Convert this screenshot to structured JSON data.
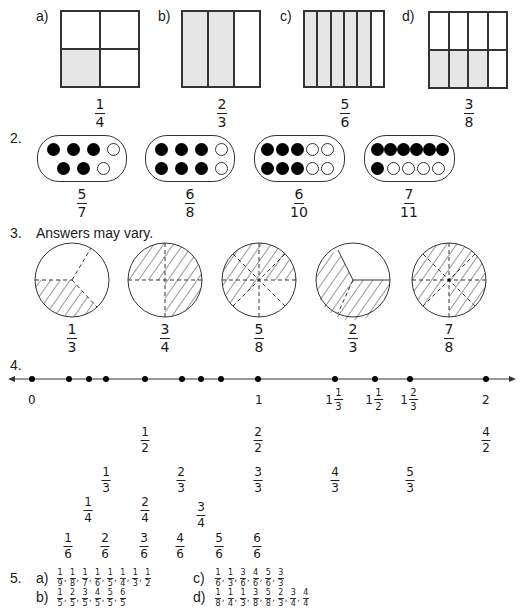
{
  "q1": {
    "items": [
      {
        "label": "a)",
        "num": "1",
        "den": "4",
        "rows": 2,
        "cols": 2,
        "shaded": [
          2
        ]
      },
      {
        "label": "b)",
        "num": "2",
        "den": "3",
        "rows": 1,
        "cols": 3,
        "shaded": [
          0,
          1
        ]
      },
      {
        "label": "c)",
        "num": "5",
        "den": "6",
        "rows": 1,
        "cols": 6,
        "shaded": [
          0,
          1,
          2,
          3,
          4
        ]
      },
      {
        "label": "d)",
        "num": "3",
        "den": "8",
        "rows": 2,
        "cols": 4,
        "shaded": [
          4,
          5,
          6
        ]
      }
    ]
  },
  "q2": {
    "number": "2.",
    "items": [
      {
        "num": "5",
        "den": "7"
      },
      {
        "num": "6",
        "den": "8"
      },
      {
        "num": "6",
        "den": "10"
      },
      {
        "num": "7",
        "den": "11"
      }
    ]
  },
  "q3": {
    "number": "3.",
    "instruction": "Answers may vary.",
    "items": [
      {
        "num": "1",
        "den": "3"
      },
      {
        "num": "3",
        "den": "4"
      },
      {
        "num": "5",
        "den": "8"
      },
      {
        "num": "2",
        "den": "3"
      },
      {
        "num": "7",
        "den": "8"
      }
    ]
  },
  "q4": {
    "number": "4.",
    "ticks": {
      "zero": "0",
      "one": "1",
      "two": "2",
      "m1": {
        "whole": "1",
        "num": "1",
        "den": "3"
      },
      "m2": {
        "whole": "1",
        "num": "1",
        "den": "2"
      },
      "m3": {
        "whole": "1",
        "num": "2",
        "den": "3"
      }
    },
    "halves": [
      {
        "num": "1",
        "den": "2"
      },
      {
        "num": "2",
        "den": "2"
      },
      {
        "num": "4",
        "den": "2"
      }
    ],
    "thirds": [
      {
        "num": "1",
        "den": "3"
      },
      {
        "num": "2",
        "den": "3"
      },
      {
        "num": "3",
        "den": "3"
      },
      {
        "num": "4",
        "den": "3"
      },
      {
        "num": "5",
        "den": "3"
      }
    ],
    "quarters": [
      {
        "num": "1",
        "den": "4"
      },
      {
        "num": "2",
        "den": "4"
      },
      {
        "num": "3",
        "den": "4"
      }
    ],
    "sixths": [
      {
        "num": "1",
        "den": "6"
      },
      {
        "num": "2",
        "den": "6"
      },
      {
        "num": "3",
        "den": "6"
      },
      {
        "num": "4",
        "den": "6"
      },
      {
        "num": "5",
        "den": "6"
      },
      {
        "num": "6",
        "den": "6"
      }
    ]
  },
  "q5": {
    "number": "5.",
    "a": {
      "label": "a)",
      "fracs": [
        [
          "1",
          "9"
        ],
        [
          "1",
          "8"
        ],
        [
          "1",
          "7"
        ],
        [
          "1",
          "6"
        ],
        [
          "1",
          "5"
        ],
        [
          "1",
          "4"
        ],
        [
          "1",
          "3"
        ],
        [
          "1",
          "2"
        ]
      ]
    },
    "b": {
      "label": "b)",
      "fracs": [
        [
          "1",
          "5"
        ],
        [
          "2",
          "5"
        ],
        [
          "3",
          "5"
        ],
        [
          "4",
          "5"
        ],
        [
          "5",
          "5"
        ],
        [
          "6",
          "5"
        ]
      ]
    },
    "c": {
      "label": "c)",
      "fracs": [
        [
          "1",
          "6"
        ],
        [
          "1",
          "3"
        ],
        [
          "3",
          "6"
        ],
        [
          "4",
          "6"
        ],
        [
          "5",
          "6"
        ],
        [
          "3",
          "3"
        ]
      ]
    },
    "d": {
      "label": "d)",
      "fracs": [
        [
          "1",
          "8"
        ],
        [
          "1",
          "4"
        ],
        [
          "1",
          "3"
        ],
        [
          "3",
          "8"
        ],
        [
          "5",
          "8"
        ],
        [
          "2",
          "3"
        ],
        [
          "3",
          "4"
        ],
        [
          "4",
          "4"
        ]
      ]
    }
  }
}
